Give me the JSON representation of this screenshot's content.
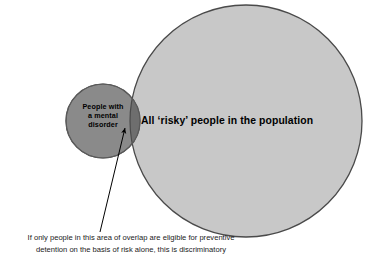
{
  "figure": {
    "name": "venn-diagram-risk-and-mental-disorder",
    "background_color": "#ffffff",
    "small_circle": {
      "label": "People with\na mental\ndisorder",
      "fill_color": "#8a8a8a",
      "stroke_color": "#5a5a5a",
      "center_x": 103,
      "center_y": 121,
      "radius": 37
    },
    "large_circle": {
      "label": "All ‘risky’ people in the population",
      "fill_color": "#c8c8c8",
      "stroke_color": "#4a4a4a",
      "center_x": 246,
      "center_y": 121,
      "radius": 116
    },
    "overlap_region": {
      "name": "area-of-overlap",
      "fill_color": "#6e6e6e"
    },
    "annotation_arrow": {
      "name": "overlap-pointer-arrow",
      "color": "#000000",
      "from_x": 100,
      "from_y": 232,
      "to_x": 125,
      "to_y": 128
    },
    "caption": "If only people in this area of overlap are eligible for preventive\ndetention on the basis of risk alone, this is discriminatory"
  }
}
